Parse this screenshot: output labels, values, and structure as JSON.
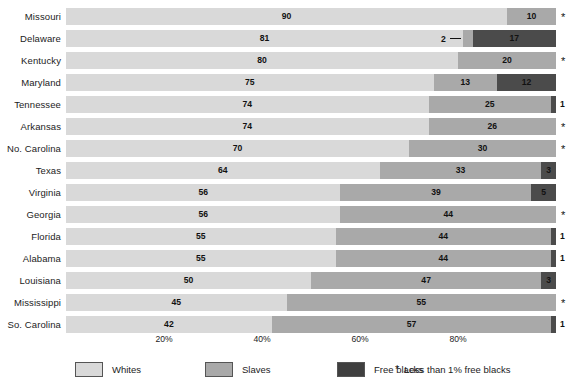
{
  "chart_data": {
    "type": "bar",
    "subtype": "stacked-horizontal-100-percent",
    "title": "",
    "xlabel": "",
    "ylabel": "",
    "xlim": [
      0,
      100
    ],
    "grid": false,
    "legend_position": "bottom",
    "categories": [
      "Missouri",
      "Delaware",
      "Kentucky",
      "Maryland",
      "Tennessee",
      "Arkansas",
      "No. Carolina",
      "Texas",
      "Virginia",
      "Georgia",
      "Florida",
      "Alabama",
      "Louisiana",
      "Mississippi",
      "So. Carolina"
    ],
    "series": [
      {
        "name": "Whites",
        "color": "#d9d9d9",
        "values": [
          90,
          81,
          80,
          75,
          74,
          74,
          70,
          64,
          56,
          56,
          55,
          55,
          50,
          45,
          42
        ]
      },
      {
        "name": "Slaves",
        "color": "#a9a9a9",
        "values": [
          10,
          2,
          20,
          13,
          25,
          26,
          30,
          33,
          39,
          44,
          44,
          44,
          47,
          55,
          57
        ]
      },
      {
        "name": "Free blacks",
        "color": "#4b4b4b",
        "values": [
          null,
          17,
          null,
          12,
          1,
          null,
          null,
          3,
          5,
          null,
          1,
          1,
          3,
          null,
          1
        ]
      }
    ],
    "xticks": [
      {
        "value": 20,
        "label": "20%"
      },
      {
        "value": 40,
        "label": "40%"
      },
      {
        "value": 60,
        "label": "60%"
      },
      {
        "value": 80,
        "label": "80%"
      }
    ],
    "star_marker": "*",
    "star_rows": [
      "Missouri",
      "Kentucky",
      "Arkansas",
      "No. Carolina",
      "Georgia",
      "Mississippi"
    ],
    "legend": [
      {
        "label": "Whites",
        "color": "#d9d9d9",
        "swatch": "legend-swatch-whites"
      },
      {
        "label": "Slaves",
        "color": "#a9a9a9",
        "swatch": "legend-swatch-slaves"
      },
      {
        "label": "Free blacks",
        "color": "#3f3f3f",
        "swatch": "legend-swatch-free-blacks"
      }
    ],
    "legend_note": "Less than 1% free blacks",
    "legend_note_marker": "*"
  },
  "rows": [
    {
      "label": "Missouri",
      "whites": 90,
      "slaves": 10,
      "free": null,
      "whites_text": "90",
      "slaves_text": "10",
      "free_text": "",
      "slaves_callout": false,
      "free_callout": false,
      "free_outside": false,
      "free_outside_text": "",
      "star": true
    },
    {
      "label": "Delaware",
      "whites": 81,
      "slaves": 2,
      "free": 17,
      "whites_text": "81",
      "slaves_text": "2",
      "free_text": "17",
      "slaves_callout": true,
      "free_callout": false,
      "free_outside": false,
      "free_outside_text": "",
      "star": false
    },
    {
      "label": "Kentucky",
      "whites": 80,
      "slaves": 20,
      "free": null,
      "whites_text": "80",
      "slaves_text": "20",
      "free_text": "",
      "slaves_callout": false,
      "free_callout": false,
      "free_outside": false,
      "free_outside_text": "",
      "star": true
    },
    {
      "label": "Maryland",
      "whites": 75,
      "slaves": 13,
      "free": 12,
      "whites_text": "75",
      "slaves_text": "13",
      "free_text": "12",
      "slaves_callout": false,
      "free_callout": false,
      "free_outside": false,
      "free_outside_text": "",
      "star": false
    },
    {
      "label": "Tennessee",
      "whites": 74,
      "slaves": 25,
      "free": 1,
      "whites_text": "74",
      "slaves_text": "25",
      "free_text": "",
      "slaves_callout": false,
      "free_callout": false,
      "free_outside": true,
      "free_outside_text": "1",
      "star": false
    },
    {
      "label": "Arkansas",
      "whites": 74,
      "slaves": 26,
      "free": null,
      "whites_text": "74",
      "slaves_text": "26",
      "free_text": "",
      "slaves_callout": false,
      "free_callout": false,
      "free_outside": false,
      "free_outside_text": "",
      "star": true
    },
    {
      "label": "No. Carolina",
      "whites": 70,
      "slaves": 30,
      "free": null,
      "whites_text": "70",
      "slaves_text": "30",
      "free_text": "",
      "slaves_callout": false,
      "free_callout": false,
      "free_outside": false,
      "free_outside_text": "",
      "star": true
    },
    {
      "label": "Texas",
      "whites": 64,
      "slaves": 33,
      "free": 3,
      "whites_text": "64",
      "slaves_text": "33",
      "free_text": "3",
      "slaves_callout": false,
      "free_callout": false,
      "free_outside": false,
      "free_outside_text": "",
      "star": false
    },
    {
      "label": "Virginia",
      "whites": 56,
      "slaves": 39,
      "free": 5,
      "whites_text": "56",
      "slaves_text": "39",
      "free_text": "5",
      "slaves_callout": false,
      "free_callout": false,
      "free_outside": false,
      "free_outside_text": "",
      "star": false
    },
    {
      "label": "Georgia",
      "whites": 56,
      "slaves": 44,
      "free": null,
      "whites_text": "56",
      "slaves_text": "44",
      "free_text": "",
      "slaves_callout": false,
      "free_callout": false,
      "free_outside": false,
      "free_outside_text": "",
      "star": true
    },
    {
      "label": "Florida",
      "whites": 55,
      "slaves": 44,
      "free": 1,
      "whites_text": "55",
      "slaves_text": "44",
      "free_text": "",
      "slaves_callout": false,
      "free_callout": false,
      "free_outside": true,
      "free_outside_text": "1",
      "star": false
    },
    {
      "label": "Alabama",
      "whites": 55,
      "slaves": 44,
      "free": 1,
      "whites_text": "55",
      "slaves_text": "44",
      "free_text": "",
      "slaves_callout": false,
      "free_callout": false,
      "free_outside": true,
      "free_outside_text": "1",
      "star": false
    },
    {
      "label": "Louisiana",
      "whites": 50,
      "slaves": 47,
      "free": 3,
      "whites_text": "50",
      "slaves_text": "47",
      "free_text": "3",
      "slaves_callout": false,
      "free_callout": false,
      "free_outside": false,
      "free_outside_text": "",
      "star": false
    },
    {
      "label": "Mississippi",
      "whites": 45,
      "slaves": 55,
      "free": null,
      "whites_text": "45",
      "slaves_text": "55",
      "free_text": "",
      "slaves_callout": false,
      "free_callout": false,
      "free_outside": false,
      "free_outside_text": "",
      "star": true
    },
    {
      "label": "So. Carolina",
      "whites": 42,
      "slaves": 57,
      "free": 1,
      "whites_text": "42",
      "slaves_text": "57",
      "free_text": "",
      "slaves_callout": false,
      "free_callout": false,
      "free_outside": true,
      "free_outside_text": "1",
      "star": false
    }
  ],
  "axis": {
    "ticks": [
      "20%",
      "40%",
      "60%",
      "80%"
    ],
    "tick_values": [
      20,
      40,
      60,
      80
    ]
  },
  "legend": {
    "items": [
      {
        "label": "Whites"
      },
      {
        "label": "Slaves"
      },
      {
        "label": "Free blacks"
      }
    ],
    "note_marker": "*",
    "note": "Less than 1% free blacks"
  },
  "colors": {
    "whites": "#d9d9d9",
    "slaves": "#a9a9a9",
    "free_blacks": "#4b4b4b",
    "text": "#1c1c1c",
    "background": "#ffffff"
  }
}
